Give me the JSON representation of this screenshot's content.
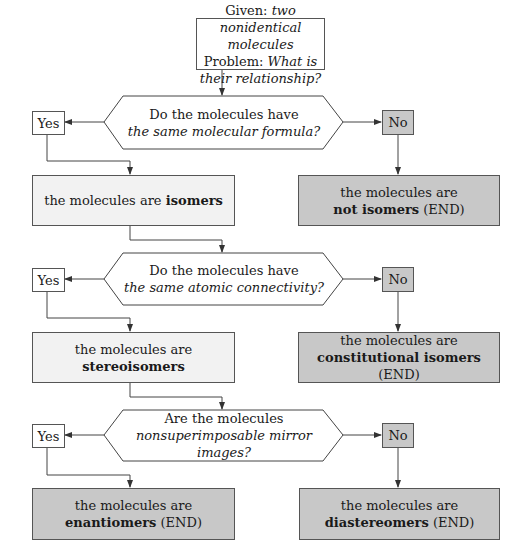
{
  "start": {
    "given_label": "Given:",
    "given_value": "two nonidentical molecules",
    "problem_label": "Problem:",
    "problem_value": "What is their relationship?"
  },
  "decisions": [
    {
      "line1": "Do the molecules have",
      "line2": "the same molecular formula?",
      "yes": "Yes",
      "no": "No"
    },
    {
      "line1": "Do the molecules have",
      "line2": "the same atomic connectivity?",
      "yes": "Yes",
      "no": "No"
    },
    {
      "line1": "Are the molecules",
      "line2": "nonsuperimposable mirror images?",
      "yes": "Yes",
      "no": "No"
    }
  ],
  "outcomes": {
    "isomers": {
      "prefix": "the molecules are",
      "bold": "isomers",
      "suffix": ""
    },
    "not_isomers": {
      "prefix": "the molecules are",
      "bold": "not isomers",
      "suffix": "(END)"
    },
    "stereoisomers": {
      "prefix": "the molecules are",
      "bold": "stereoisomers",
      "suffix": ""
    },
    "constitutional": {
      "prefix": "the molecules are",
      "bold": "constitutional isomers",
      "suffix": "(END)"
    },
    "enantiomers": {
      "prefix": "the molecules are",
      "bold": "enantiomers",
      "suffix": "(END)"
    },
    "diastereomers": {
      "prefix": "the molecules are",
      "bold": "diastereomers",
      "suffix": "(END)"
    }
  },
  "colors": {
    "light_fill": "#f2f2f2",
    "dark_fill": "#c8c8c8",
    "stroke": "#555555"
  }
}
